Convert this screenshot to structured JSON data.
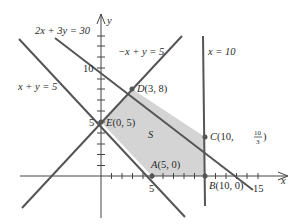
{
  "diagram": {
    "type": "linear-programming-feasible-region",
    "axes": {
      "x_label": "x",
      "y_label": "y",
      "x_ticks_labeled": [
        "5",
        "10",
        "15"
      ],
      "y_ticks_labeled": [
        "5",
        "10"
      ]
    },
    "lines": [
      {
        "equation": "2x + 3y = 30"
      },
      {
        "equation": "−x + y = 5"
      },
      {
        "equation": "x + y = 5"
      },
      {
        "equation": "x = 10"
      }
    ],
    "region_label": "S",
    "points": [
      {
        "name": "A",
        "coords": "(5, 0)"
      },
      {
        "name": "B",
        "coords": "(10, 0)"
      },
      {
        "name": "C",
        "coords_prefix": "(10, ",
        "frac_num": "10",
        "frac_den": "3",
        "coords_suffix": ")"
      },
      {
        "name": "D",
        "coords": "(3, 8)"
      },
      {
        "name": "E",
        "coords": "(0, 5)"
      }
    ],
    "colors": {
      "region_fill": "#d4d4d4",
      "line": "#555555",
      "axis": "#444444"
    }
  }
}
